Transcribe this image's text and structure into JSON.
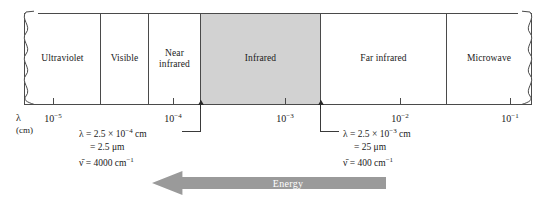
{
  "figure": {
    "type": "electromagnetic-spectrum-diagram",
    "axis": {
      "variable_label": "λ",
      "unit_label": "(cm)",
      "scale": "log10",
      "tick_labels": [
        "10−5",
        "10−4",
        "10−3",
        "10−2",
        "10−1"
      ],
      "ticks": [
        {
          "mantissa": "10",
          "exponent": "−5",
          "x": 53
        },
        {
          "mantissa": "10",
          "exponent": "−4",
          "x": 173
        },
        {
          "mantissa": "10",
          "exponent": "−3",
          "x": 285
        },
        {
          "mantissa": "10",
          "exponent": "−2",
          "x": 400
        },
        {
          "mantissa": "10",
          "exponent": "−1",
          "x": 510
        }
      ]
    },
    "bands": [
      {
        "label": "Ultraviolet",
        "left": 0,
        "width": 76,
        "shaded": false
      },
      {
        "label": "Visible",
        "left": 76,
        "width": 48,
        "shaded": false
      },
      {
        "label": "Near\ninfrared",
        "left": 124,
        "width": 52,
        "shaded": false
      },
      {
        "label": "Infrared",
        "left": 176,
        "width": 120,
        "shaded": true
      },
      {
        "label": "Far infrared",
        "left": 296,
        "width": 126,
        "shaded": false
      },
      {
        "label": "Microwave",
        "left": 422,
        "width": 86,
        "shaded": false
      }
    ],
    "boundary_markers": [
      {
        "name": "infrared-lower-bound",
        "x": 200
      },
      {
        "name": "infrared-upper-bound",
        "x": 320
      }
    ],
    "callouts": [
      {
        "name": "infrared-lower-bound-callout",
        "lines": [
          {
            "text": "λ = 2.5 × 10",
            "sup": "−4",
            "tail": " cm",
            "indent": false
          },
          {
            "text": "= 2.5 μm",
            "sup": "",
            "tail": "",
            "indent": true
          },
          {
            "text": "ν̄ = 4000 cm",
            "sup": "−1",
            "tail": "",
            "indent": false
          }
        ]
      },
      {
        "name": "infrared-upper-bound-callout",
        "lines": [
          {
            "text": "λ = 2.5 × 10",
            "sup": "−3",
            "tail": " cm",
            "indent": false
          },
          {
            "text": "= 25 μm",
            "sup": "",
            "tail": "",
            "indent": true
          },
          {
            "text": "ν̄ = 400 cm",
            "sup": "−1",
            "tail": "",
            "indent": false
          }
        ]
      }
    ],
    "energy_arrow": {
      "label": "Energy",
      "direction": "left",
      "color": "#9a9a9a",
      "label_color": "#ffffff"
    },
    "colors": {
      "shaded_band": "#d2d2d2",
      "stroke": "#4a4a4a",
      "background": "#ffffff",
      "arrow": "#9a9a9a"
    },
    "break_edges": [
      "left",
      "right"
    ]
  }
}
